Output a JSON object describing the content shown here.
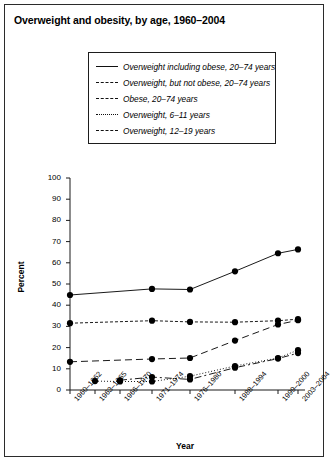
{
  "figure": {
    "title": "Overweight and obesity, by age, 1960–2004"
  },
  "legend": {
    "items": [
      {
        "label": "Overweight including obese, 20–74 years",
        "style": "solid"
      },
      {
        "label": "Overweight, but not obese, 20–74 years",
        "style": "dash-small"
      },
      {
        "label": "Obese, 20–74 years",
        "style": "dash-large"
      },
      {
        "label": "Overweight, 6–11 years",
        "style": "dotted"
      },
      {
        "label": "Overweight, 12–19 years",
        "style": "dash-dot"
      }
    ]
  },
  "chart_data": {
    "type": "line",
    "title": "Overweight and obesity, by age, 1960–2004",
    "xlabel": "Year",
    "ylabel": "Percent",
    "ylim": [
      0,
      100
    ],
    "yticks": [
      0,
      10,
      20,
      30,
      40,
      50,
      60,
      70,
      80,
      90,
      100
    ],
    "grid": false,
    "legend_position": "top-center",
    "categories": [
      "1960–1962",
      "1963–1965",
      "1966–1970",
      "1971–1974",
      "1976–1980",
      "1988–1994",
      "1999–2000",
      "2003–2004"
    ],
    "series": [
      {
        "name": "Overweight including obese, 20–74 years",
        "style": "solid",
        "values": [
          44.8,
          null,
          null,
          47.7,
          47.4,
          56.0,
          64.5,
          66.3
        ]
      },
      {
        "name": "Overweight, but not obese, 20–74 years",
        "style": "dash-small",
        "values": [
          31.5,
          null,
          null,
          32.7,
          32.1,
          32.0,
          32.7,
          33.4
        ]
      },
      {
        "name": "Obese, 20–74 years",
        "style": "dash-large",
        "values": [
          13.3,
          null,
          null,
          14.6,
          15.1,
          23.3,
          30.9,
          32.9
        ]
      },
      {
        "name": "Overweight, 6–11 years",
        "style": "dotted",
        "values": [
          null,
          4.2,
          4.0,
          4.0,
          6.5,
          11.3,
          15.1,
          18.8
        ]
      },
      {
        "name": "Overweight, 12–19 years",
        "style": "dash-dot",
        "values": [
          null,
          null,
          4.6,
          6.1,
          5.0,
          10.5,
          14.8,
          17.4
        ]
      }
    ]
  }
}
